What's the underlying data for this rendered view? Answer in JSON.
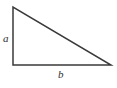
{
  "figure": {
    "type": "right-triangle-diagram",
    "background_color": "#ffffff",
    "stroke_color": "#3a3a3a",
    "stroke_width": 1.5,
    "width": 117,
    "height": 88
  },
  "geometry": {
    "vertices": {
      "apex_top_left": {
        "x": 13,
        "y": 7
      },
      "right_angle_bottom_left": {
        "x": 13,
        "y": 65
      },
      "vertex_bottom_right": {
        "x": 111,
        "y": 65
      }
    },
    "edges": [
      {
        "name": "vertical-leg",
        "from": "apex_top_left",
        "to": "right_angle_bottom_left",
        "label": "a"
      },
      {
        "name": "horizontal-leg",
        "from": "right_angle_bottom_left",
        "to": "vertex_bottom_right",
        "label": "b"
      },
      {
        "name": "hypotenuse",
        "from": "apex_top_left",
        "to": "vertex_bottom_right",
        "label": ""
      }
    ],
    "right_angle_marker": false
  },
  "labels": {
    "vertical_leg": "a",
    "horizontal_leg": "b"
  }
}
